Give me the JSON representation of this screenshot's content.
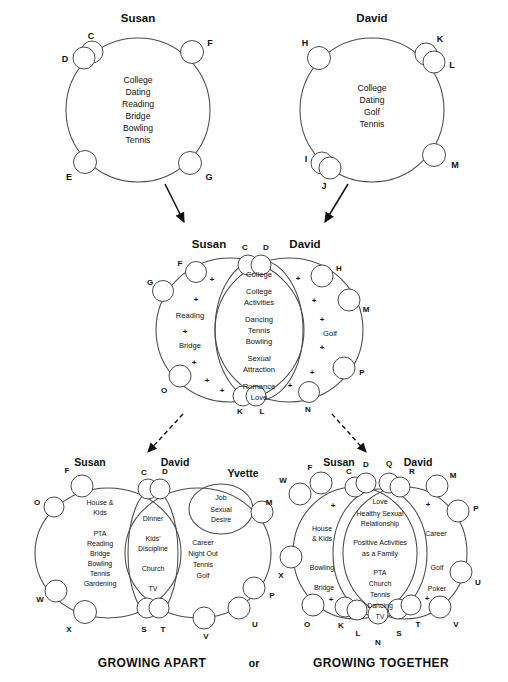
{
  "meta": {
    "colors": {
      "susan_fill": "#e6e6e6",
      "david_fill": "#c6c6c6",
      "overlap_fill": "#b8b8b8",
      "white": "#ffffff",
      "stroke": "#4a4a4a",
      "text": "#111111"
    }
  },
  "top": {
    "susan": {
      "name": "Susan",
      "items": [
        "College",
        "Dating",
        "Reading",
        "Bridge",
        "Bowling",
        "Tennis"
      ],
      "letters": [
        "C",
        "D",
        "F",
        "E",
        "G"
      ]
    },
    "david": {
      "name": "David",
      "items": [
        "College",
        "Dating",
        "Golf",
        "Tennis"
      ],
      "letters": [
        "H",
        "K",
        "L",
        "I",
        "J",
        "M"
      ]
    }
  },
  "middle": {
    "susan_name": "Susan",
    "david_name": "David",
    "susan_only": [
      "Reading",
      "Bridge"
    ],
    "david_only": [
      "Golf"
    ],
    "shared": [
      "College",
      "College",
      "Activities",
      "Dancing",
      "Tennis",
      "Bowling",
      "Sexual",
      "Attraction",
      "Romance",
      "Love"
    ],
    "letters": [
      "C",
      "D",
      "F",
      "G",
      "H",
      "M",
      "P",
      "O",
      "K",
      "L",
      "N"
    ],
    "plus_symbol": "+"
  },
  "bottom_left": {
    "caption": "GROWING APART",
    "susan_name": "Susan",
    "david_name": "David",
    "yvette_name": "Yvette",
    "susan_only": [
      "House &",
      "Kids",
      "",
      "PTA",
      "Reading",
      "Bridge",
      "Bowling",
      "Tennis",
      "Gardening"
    ],
    "shared": [
      "Dinner",
      "",
      "Kids'",
      "Discipline",
      "",
      "Church",
      "",
      "TV"
    ],
    "david_only": [
      "Career",
      "Night Out",
      "Tennis",
      "Golf"
    ],
    "yvette_bubble": [
      "Job",
      "",
      "Sexual",
      "Desire"
    ],
    "letters": [
      "F",
      "O",
      "W",
      "X",
      "C",
      "D",
      "S",
      "T",
      "M",
      "P",
      "U",
      "V"
    ]
  },
  "bottom_right": {
    "caption": "GROWING TOGETHER",
    "susan_name": "Susan",
    "david_name": "David",
    "susan_only": [
      "House",
      "& Kids",
      "",
      "Bowling",
      "",
      "Bridge"
    ],
    "david_only": [
      "Career",
      "",
      "Golf",
      "",
      "Poker"
    ],
    "shared": [
      "Love",
      "Healthy Sexual",
      "Relationship",
      "",
      "Positive Activities",
      "as a Family",
      "",
      "PTA",
      "Church",
      "Tennis",
      "Dancing",
      "TV"
    ],
    "letters": [
      "F",
      "W",
      "X",
      "O",
      "C",
      "D",
      "Q",
      "R",
      "M",
      "P",
      "U",
      "V",
      "K",
      "L",
      "N",
      "S",
      "T"
    ],
    "plus_symbol": "+"
  },
  "footer": {
    "left_caption": "GROWING APART",
    "or": "or",
    "right_caption": "GROWING TOGETHER"
  }
}
